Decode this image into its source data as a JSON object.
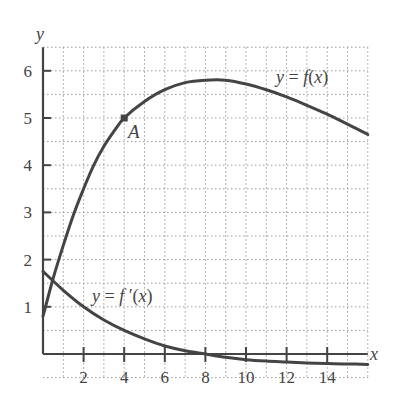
{
  "chart_data": {
    "type": "line",
    "title": "",
    "xlabel": "x",
    "ylabel": "y",
    "xlim": [
      0,
      16
    ],
    "ylim": [
      -0.5,
      6.5
    ],
    "grid": true,
    "grid_style": "dotted",
    "x_ticks": [
      2,
      4,
      6,
      8,
      10,
      12,
      14
    ],
    "x_tick_labels": [
      "2",
      "4",
      "6",
      "8",
      "10",
      "12",
      "14"
    ],
    "y_ticks": [
      1,
      2,
      3,
      4,
      5,
      6
    ],
    "y_tick_labels": [
      "1",
      "2",
      "3",
      "4",
      "5",
      "6"
    ],
    "series": [
      {
        "name": "y = f(x)",
        "label": "y = f(x)",
        "x": [
          0,
          0.5,
          1,
          1.5,
          2,
          2.5,
          3,
          3.5,
          4,
          5,
          6,
          7,
          8,
          9,
          10,
          11,
          12,
          13,
          14,
          15,
          16
        ],
        "y": [
          0.8,
          1.6,
          2.3,
          2.95,
          3.5,
          4.0,
          4.4,
          4.72,
          5.0,
          5.35,
          5.6,
          5.75,
          5.8,
          5.8,
          5.72,
          5.6,
          5.45,
          5.27,
          5.08,
          4.87,
          4.65
        ]
      },
      {
        "name": "y = f'(x)",
        "label": "y = f′(x)",
        "x": [
          0,
          1,
          2,
          3,
          4,
          5,
          6,
          7,
          8,
          9,
          10,
          11,
          12,
          13,
          14,
          15,
          16
        ],
        "y": [
          1.75,
          1.35,
          1.0,
          0.72,
          0.5,
          0.32,
          0.17,
          0.07,
          0.0,
          -0.07,
          -0.12,
          -0.15,
          -0.17,
          -0.19,
          -0.2,
          -0.21,
          -0.22
        ]
      }
    ],
    "annotations": [
      {
        "text": "A",
        "x": 4,
        "y": 5,
        "marker": "point"
      }
    ]
  },
  "labels": {
    "x_axis": "x",
    "y_axis": "y",
    "f_curve": "y = f(x)",
    "fprime_curve": "y = f′(x)",
    "point_a": "A"
  },
  "colors": {
    "curve": "#444444",
    "axis": "#444444",
    "grid": "#9a9a9a"
  }
}
